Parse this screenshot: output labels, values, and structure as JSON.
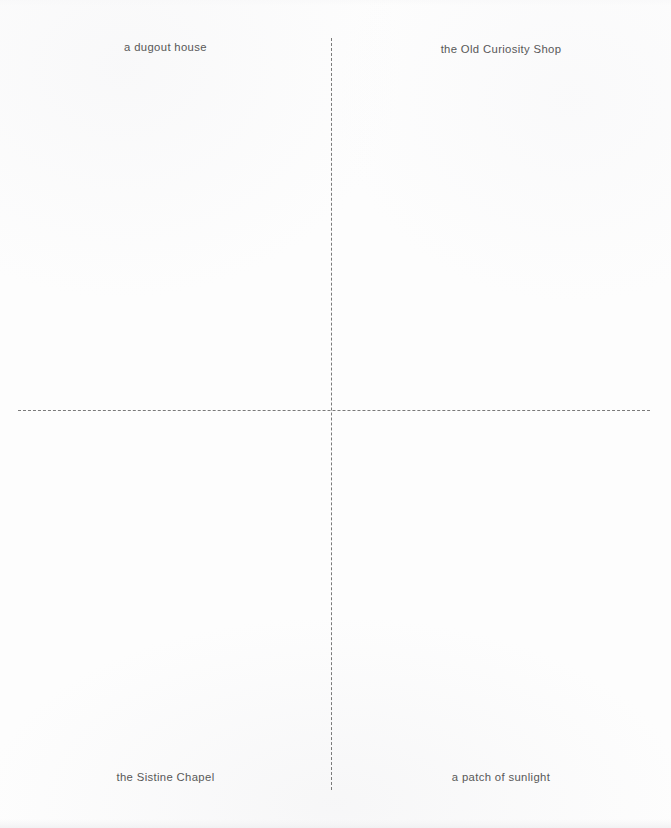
{
  "page": {
    "width": 671,
    "height": 828,
    "background_color": "#fdfdfd",
    "text_color": "#585858",
    "line_color": "#7a7a7a"
  },
  "diagram": {
    "type": "quadrant-crosshair",
    "axes": {
      "vertical": {
        "x": 331,
        "y_start": 38,
        "y_end": 790,
        "style": "dashed"
      },
      "horizontal": {
        "y": 410,
        "x_start": 18,
        "x_end": 650,
        "style": "dashed"
      }
    },
    "quadrants": [
      {
        "position": "top-left",
        "label": "a dugout house"
      },
      {
        "position": "top-right",
        "label": "the Old Curiosity Shop"
      },
      {
        "position": "bottom-left",
        "label": "the Sistine Chapel"
      },
      {
        "position": "bottom-right",
        "label": "a patch of sunlight"
      }
    ]
  }
}
